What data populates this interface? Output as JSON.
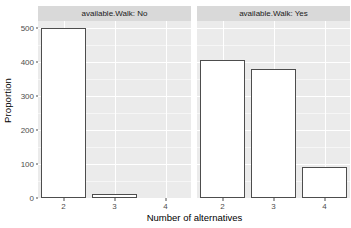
{
  "chart_data": {
    "type": "bar",
    "title": "",
    "subtitle": "",
    "xlabel": "Number of alternatives",
    "ylabel": "Proportion",
    "categories": [
      "2",
      "3",
      "4"
    ],
    "xlim": [
      1.5,
      4.5
    ],
    "ylim": [
      0,
      520
    ],
    "y_ticks": [
      0,
      100,
      200,
      300,
      400,
      500
    ],
    "y_tick_labels": [
      "0",
      "100",
      "200",
      "300",
      "400",
      "500"
    ],
    "x_ticks": [
      2,
      3,
      4
    ],
    "x_tick_labels": [
      "2",
      "3",
      "4"
    ],
    "grid": true,
    "legend": "none",
    "facet_variable": "available.Walk",
    "facets": [
      {
        "label": "available.Walk: No",
        "facet_value": "No",
        "categories": [
          "2",
          "3",
          "4"
        ],
        "values": [
          500,
          13,
          0
        ]
      },
      {
        "label": "available.Walk: Yes",
        "facet_value": "Yes",
        "categories": [
          "2",
          "3",
          "4"
        ],
        "values": [
          405,
          380,
          92
        ]
      }
    ],
    "style": {
      "panel_background": "#ebebeb",
      "gridline_color": "#ffffff",
      "strip_background": "#d9d9d9",
      "bar_fill": "#ffffff",
      "bar_border": "#4d4d4d",
      "text_color": "#4d4d4d",
      "page_background": "#ffffff"
    }
  },
  "axis": {
    "y_title": "Proportion",
    "x_title": "Number of alternatives",
    "y_labels": [
      "500",
      "400",
      "300",
      "200",
      "100",
      "0"
    ],
    "x_labels": [
      "2",
      "3",
      "4"
    ]
  },
  "facet_labels": {
    "left": "available.Walk: No",
    "right": "available.Walk: Yes"
  }
}
